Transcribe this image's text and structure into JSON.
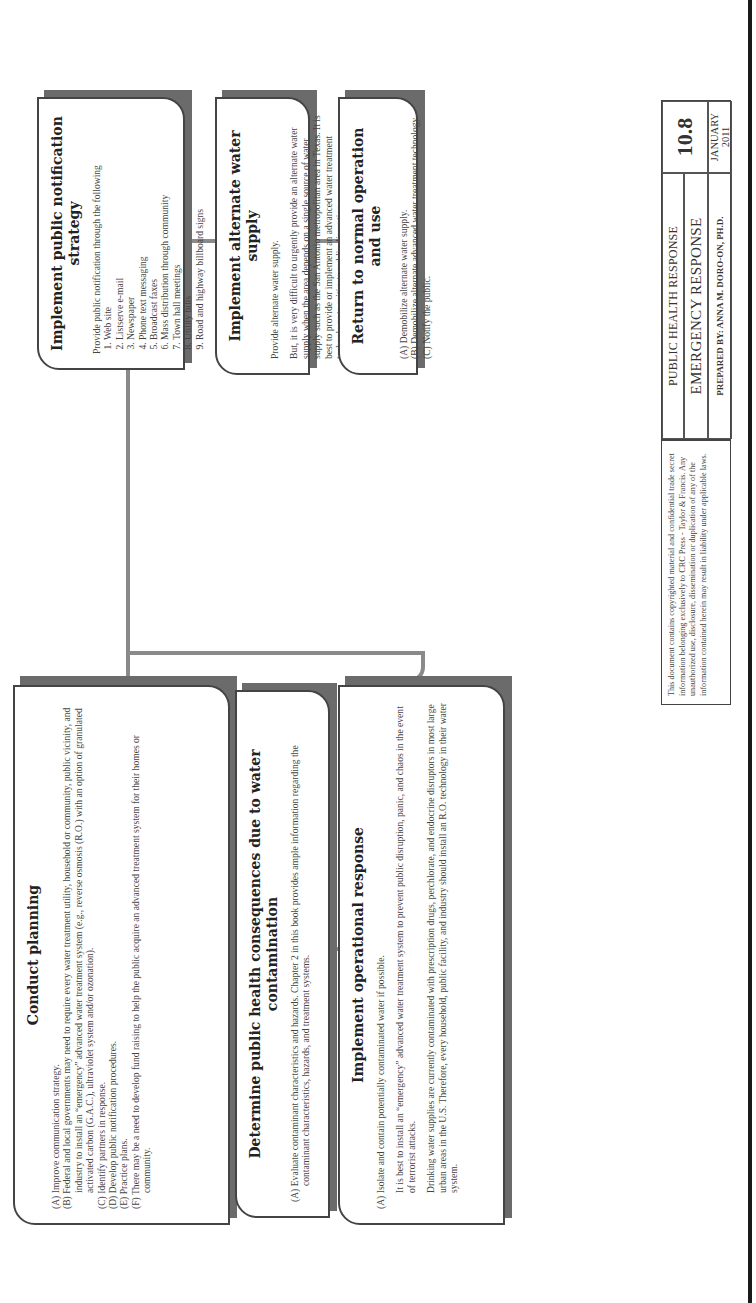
{
  "document": {
    "orientation": "landscape rotated 90 degrees counter-clockwise"
  },
  "boxes": {
    "conduct_planning": {
      "title": "Conduct planning",
      "items": [
        {
          "label": "(A)",
          "text": "Improve communication strategy."
        },
        {
          "label": "(B)",
          "text": "Federal and local governments may need to require every water treatment utility, household or community, public vicinity, and industry to install an “emergency” advanced water treatment system (e.g., reverse osmosis (R.O.) with an option of granulated activated carbon (G.A.C.), ultraviolet system and/or ozonation)."
        },
        {
          "label": "(C)",
          "text": "Identify partners in response."
        },
        {
          "label": "(D)",
          "text": "Develop public notification procedures."
        },
        {
          "label": "(E)",
          "text": "Practice plans."
        },
        {
          "label": "(F)",
          "text": "There may be a need to develop fund raising to help the public acquire an advanced treatment system for their homes or community."
        }
      ]
    },
    "determine_consequences": {
      "title": "Determine public health consequences due to water contamination",
      "items": [
        {
          "label": "(A)",
          "text": "Evaluate contaminant characteristics and hazards. Chapter 2 in this book provides ample information regarding the contaminant characteristics, hazards, and treatment systems."
        }
      ]
    },
    "operational_response": {
      "title": "Implement operational response",
      "items": [
        {
          "label": "(A)",
          "text": "Isolate and contain potentially contaminated water if possible."
        }
      ],
      "paragraphs": [
        "It is best to install an “emergency” advanced water treatment system to prevent public disruption, panic, and chaos in the event of terrorist attacks.",
        "Drinking water supplies are currently contaminated with prescription drugs, perchlorate, and endocrine disruptors in most large urban areas in the U.S. Therefore, every household, public facility, and industry should install an R.O. technology in their water system."
      ]
    },
    "public_notification": {
      "title": "Implement public notification strategy",
      "intro": "Provide public notification through the following",
      "list": [
        "Web site",
        "Listserve e-mail",
        "Newspaper",
        "Phone text messaging",
        "Broadcast faxes",
        "Mass distribution through community",
        "Town hall meetings",
        "Utility bills",
        "Road and highway billboard signs"
      ]
    },
    "alternate_supply": {
      "title": "Implement alternate water supply",
      "paragraphs": [
        "Provide alternate water supply.",
        "But, it is very difficult to urgently provide an alternate water supply when the area depends on a single source of water supply such as the San Antonio metropolitan area in Texas. It is best to provide or implement an advanced water treatment technology to mitigate public disruption."
      ]
    },
    "return_normal": {
      "title": "Return to normal operation and use",
      "items": [
        {
          "label": "(A)",
          "text": "Demobilize alternate water supply."
        },
        {
          "label": "(B)",
          "text": "Demobilize alternate advanced water treatment technology."
        },
        {
          "label": "(C)",
          "text": "Notify the public."
        }
      ]
    }
  },
  "footer": {
    "copyright": "This document contains copyrighted material and confidential trade secret information belonging exclusively to CRC Press - Taylor & Francis. Any unauthorized use, disclosure, dissemination or duplication of any of the information contained herein may result in liability under applicable laws.",
    "title_block": {
      "line1": "PUBLIC HEALTH RESPONSE",
      "line2": "EMERGENCY RESPONSE",
      "prepared_by": "PREPARED BY: ANNA M. DORO-ON, PH.D.",
      "number": "10.8",
      "month": "JANUARY",
      "year": "2011"
    }
  },
  "colors": {
    "box_border": "#444444",
    "box_shadow": "#6b6b6b",
    "connector": "#8a8a8a",
    "text": "#3a3a3a",
    "page_border": "#1a1a1a"
  }
}
